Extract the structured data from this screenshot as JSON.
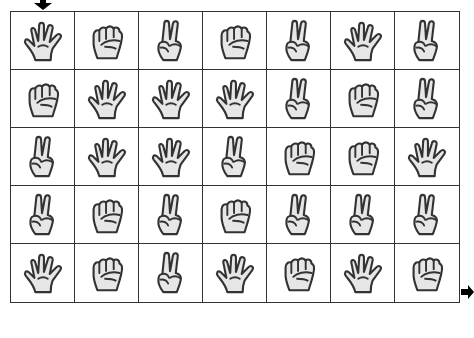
{
  "puzzle": {
    "start_marker": "down-arrow",
    "end_marker": "right-arrow",
    "rows": 5,
    "cols": 7,
    "grid": [
      [
        "paper",
        "rock",
        "scissors",
        "rock",
        "scissors",
        "paper",
        "scissors"
      ],
      [
        "rock",
        "paper",
        "paper",
        "paper",
        "scissors",
        "rock",
        "scissors"
      ],
      [
        "scissors",
        "paper",
        "paper",
        "scissors",
        "rock",
        "rock",
        "paper"
      ],
      [
        "scissors",
        "rock",
        "scissors",
        "rock",
        "scissors",
        "scissors",
        "scissors"
      ],
      [
        "paper",
        "rock",
        "scissors",
        "paper",
        "rock",
        "paper",
        "rock"
      ]
    ]
  },
  "colors": {
    "line": "#333333",
    "hand_fill": "#e6e6e6",
    "arrow": "#000000"
  }
}
